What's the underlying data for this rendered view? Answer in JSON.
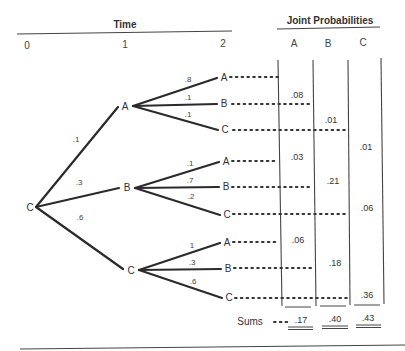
{
  "header": {
    "time_title": "Time",
    "time_periods": [
      "0",
      "1",
      "2"
    ],
    "joint_title": "Joint Probabilities",
    "columns": [
      "A",
      "B",
      "C"
    ]
  },
  "tree": {
    "root": "C",
    "first_stage": [
      {
        "label": "A",
        "prob": ".1"
      },
      {
        "label": "B",
        "prob": ".3"
      },
      {
        "label": "C",
        "prob": ".6"
      }
    ],
    "second_stage": [
      {
        "parent": "A",
        "branches": [
          {
            "label": "A",
            "prob": ".8",
            "joint": ".08",
            "column": "A"
          },
          {
            "label": "B",
            "prob": ".1",
            "joint": ".01",
            "column": "B"
          },
          {
            "label": "C",
            "prob": ".1",
            "joint": ".01",
            "column": "C"
          }
        ]
      },
      {
        "parent": "B",
        "branches": [
          {
            "label": "A",
            "prob": ".1",
            "joint": ".03",
            "column": "A"
          },
          {
            "label": "B",
            "prob": ".7",
            "joint": ".21",
            "column": "B"
          },
          {
            "label": "C",
            "prob": ".2",
            "joint": ".06",
            "column": "C"
          }
        ]
      },
      {
        "parent": "C",
        "branches": [
          {
            "label": "A",
            "prob": "1",
            "joint": ".06",
            "column": "A"
          },
          {
            "label": "B",
            "prob": ".3",
            "joint": ".18",
            "column": "B"
          },
          {
            "label": "C",
            "prob": ".6",
            "joint": ".36",
            "column": "C"
          }
        ]
      }
    ]
  },
  "sums": {
    "label": "Sums",
    "values": [
      ".17",
      ".40",
      ".43"
    ]
  }
}
